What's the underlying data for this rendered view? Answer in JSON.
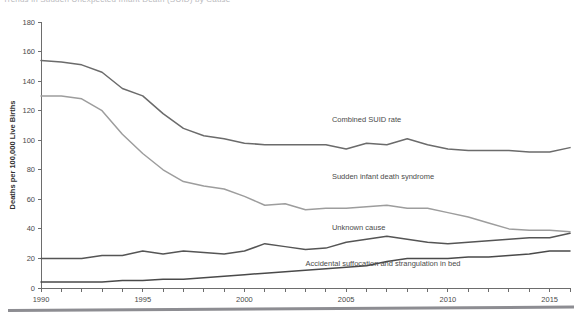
{
  "document": {
    "clipped_title": "Trends in Sudden Unexpected Infant Death (SUID) by Cause",
    "bottom_rule": "horizontal-rule"
  },
  "chart_data": {
    "type": "line",
    "title": "",
    "xlabel": "",
    "ylabel": "Deaths per 100,000 Live Births",
    "xlim": [
      1990,
      2016
    ],
    "ylim": [
      0,
      180
    ],
    "ytick_step": 20,
    "yticks": [
      0,
      20,
      40,
      60,
      80,
      100,
      120,
      140,
      160,
      180
    ],
    "xticks": [
      1990,
      1991,
      1992,
      1993,
      1994,
      1995,
      1996,
      1997,
      1998,
      1999,
      2000,
      2001,
      2002,
      2003,
      2004,
      2005,
      2006,
      2007,
      2008,
      2009,
      2010,
      2011,
      2012,
      2013,
      2014,
      2015,
      2016
    ],
    "xtick_labels": [
      1990,
      1995,
      2000,
      2005,
      2010,
      2015
    ],
    "grid": false,
    "legend": "inline-labels",
    "x": [
      1990,
      1991,
      1992,
      1993,
      1994,
      1995,
      1996,
      1997,
      1998,
      1999,
      2000,
      2001,
      2002,
      2003,
      2004,
      2005,
      2006,
      2007,
      2008,
      2009,
      2010,
      2011,
      2012,
      2013,
      2014,
      2015,
      2016
    ],
    "series": [
      {
        "name": "Combined SUID rate",
        "color": "#6b6b6b",
        "width": 1.5,
        "label_x": 2004.3,
        "label_y": 112,
        "values": [
          154,
          153,
          151,
          146,
          135,
          130,
          118,
          108,
          103,
          101,
          98,
          97,
          97,
          97,
          97,
          94,
          98,
          97,
          101,
          97,
          94,
          93,
          93,
          93,
          92,
          92,
          95
        ]
      },
      {
        "name": "Sudden infant death syndrome",
        "color": "#9d9d9d",
        "width": 1.5,
        "label_x": 2004.3,
        "label_y": 74,
        "values": [
          130,
          130,
          128,
          120,
          104,
          91,
          80,
          72,
          69,
          67,
          62,
          56,
          57,
          53,
          54,
          54,
          55,
          56,
          54,
          54,
          51,
          48,
          44,
          40,
          39,
          39,
          38
        ]
      },
      {
        "name": "Unknown cause",
        "color": "#555555",
        "width": 1.5,
        "label_x": 2004.3,
        "label_y": 39,
        "values": [
          20,
          20,
          20,
          22,
          22,
          25,
          23,
          25,
          24,
          23,
          25,
          30,
          28,
          26,
          27,
          31,
          33,
          35,
          33,
          31,
          30,
          31,
          32,
          33,
          34,
          34,
          37
        ]
      },
      {
        "name": "Accidental suffocation and strangulation in bed",
        "color": "#4a4a4a",
        "width": 1.5,
        "label_x": 2003.0,
        "label_y": 15,
        "values": [
          4,
          4,
          4,
          4,
          5,
          5,
          6,
          6,
          7,
          8,
          9,
          10,
          11,
          12,
          13,
          14,
          15,
          18,
          20,
          20,
          20,
          21,
          21,
          22,
          23,
          25,
          25
        ]
      }
    ]
  }
}
